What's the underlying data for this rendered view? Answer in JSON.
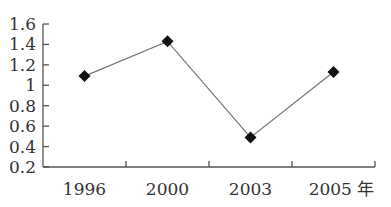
{
  "chart_data": {
    "type": "line",
    "title": "",
    "xlabel": "年",
    "ylabel": "",
    "categories": [
      "1996",
      "2000",
      "2003",
      "2005"
    ],
    "series": [
      {
        "name": "",
        "values": [
          1.09,
          1.43,
          0.49,
          1.13
        ],
        "marker": "diamond",
        "color": "#111111"
      }
    ],
    "y_ticks": [
      "1.6",
      "1.4",
      "1.2",
      "1",
      "0.8",
      "0.6",
      "0.4",
      "0.2"
    ],
    "ylim": [
      0.2,
      1.6
    ],
    "grid": false,
    "legend": "none",
    "x_unit_label": "年"
  }
}
